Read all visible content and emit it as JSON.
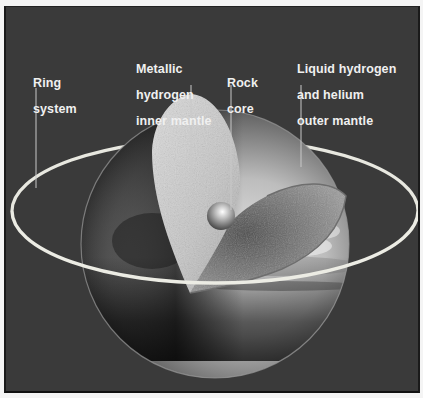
{
  "diagram": {
    "colors": {
      "background": "#3a3a3a",
      "ring": "#e8e8e0",
      "label_text": "#f0f0f0",
      "leader_line": "#c8c8c8"
    },
    "labels": [
      {
        "id": "ring-system",
        "lines": [
          "Ring",
          "system"
        ]
      },
      {
        "id": "metallic-hydrogen-inner-mantle",
        "lines": [
          "Metallic",
          "hydrogen",
          "inner mantle"
        ]
      },
      {
        "id": "rock-core",
        "lines": [
          "Rock",
          "core"
        ]
      },
      {
        "id": "liquid-hydrogen-helium-outer-mantle",
        "lines": [
          "Liquid hydrogen",
          "and helium",
          "outer mantle"
        ]
      }
    ]
  }
}
